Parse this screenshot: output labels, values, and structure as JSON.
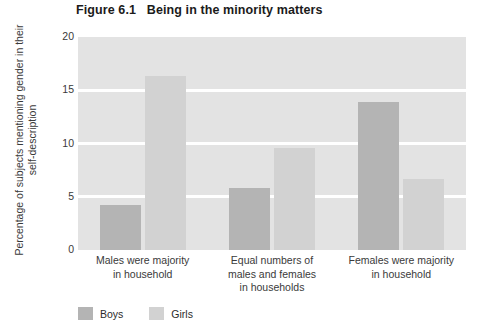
{
  "figure": {
    "number": "Figure 6.1",
    "title": "Being in the minority matters",
    "full_title": "Figure 6.1   Being in the minority matters"
  },
  "legend": {
    "position": "bottom-left",
    "items": [
      {
        "label": "Boys",
        "color": "#b4b4b4",
        "swatch_name": "boys-swatch"
      },
      {
        "label": "Girls",
        "color": "#d2d2d2",
        "swatch_name": "girls-swatch"
      }
    ]
  },
  "axes": {
    "y_title": "Percentage of subjects mentioning gender in their self-description",
    "y_ticks": [
      "0",
      "5",
      "10",
      "15",
      "20"
    ],
    "x_categories": [
      "Males were majority in household",
      "Equal numbers of males and females in households",
      "Females were majority in household"
    ]
  },
  "colors": {
    "plot_background": "#e3e3e3",
    "gridline": "#ffffff",
    "boys_bar": "#b4b4b4",
    "girls_bar": "#d2d2d2",
    "title_text": "#1b1b1b",
    "axis_text": "#3a3a3a"
  },
  "chart_data": {
    "type": "bar",
    "title": "Figure 6.1   Being in the minority matters",
    "xlabel": "",
    "ylabel": "Percentage of subjects mentioning gender in their self-description",
    "ylim": [
      0,
      20
    ],
    "yticks": [
      0,
      5,
      10,
      15,
      20
    ],
    "grid": true,
    "grid_axis": "y",
    "legend_position": "bottom-left",
    "categories": [
      "Males were majority in household",
      "Equal numbers of males and females in households",
      "Females were majority in household"
    ],
    "category_lines": [
      [
        "Males were majority",
        "in household"
      ],
      [
        "Equal numbers of",
        "males and females",
        "in households"
      ],
      [
        "Females were majority",
        "in household"
      ]
    ],
    "series": [
      {
        "name": "Boys",
        "color": "#b4b4b4",
        "values": [
          4.2,
          5.8,
          13.9
        ]
      },
      {
        "name": "Girls",
        "color": "#d2d2d2",
        "values": [
          16.3,
          9.6,
          6.7
        ]
      }
    ]
  }
}
